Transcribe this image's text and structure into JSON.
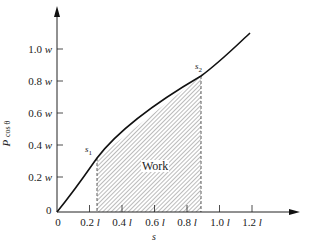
{
  "diagram": {
    "y_axis": {
      "label": "P",
      "label_sub": "cos θ",
      "ticks": [
        {
          "value": "1.0",
          "unit": "w"
        },
        {
          "value": "0.8",
          "unit": "w"
        },
        {
          "value": "0.6",
          "unit": "w"
        },
        {
          "value": "0.4",
          "unit": "w"
        },
        {
          "value": "0.2",
          "unit": "w"
        },
        {
          "value": "0",
          "unit": ""
        }
      ]
    },
    "x_axis": {
      "label": "s",
      "ticks": [
        {
          "value": "0",
          "unit": ""
        },
        {
          "value": "0.2",
          "unit": "l"
        },
        {
          "value": "0.4",
          "unit": "l"
        },
        {
          "value": "0.6",
          "unit": "l"
        },
        {
          "value": "0.8",
          "unit": "l"
        },
        {
          "value": "1.0",
          "unit": "l"
        },
        {
          "value": "1.2",
          "unit": "l"
        }
      ]
    },
    "points": {
      "s1": {
        "name": "s",
        "sub": "1"
      },
      "s2": {
        "name": "s",
        "sub": "2"
      }
    },
    "region_label": "Work"
  }
}
